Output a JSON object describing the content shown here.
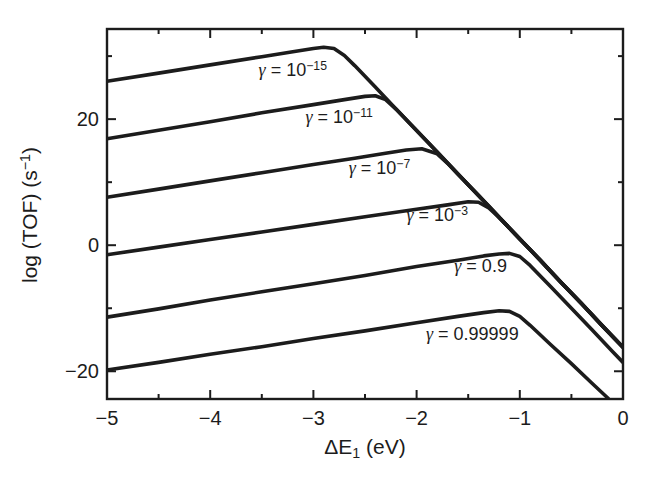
{
  "meta": {
    "ink_color": "#1c1c1c",
    "bg_color": "#ffffff"
  },
  "axes": {
    "x": {
      "title_parts": [
        {
          "t": "ΔE"
        },
        {
          "t": "1",
          "sub": true
        },
        {
          "t": " (eV)"
        }
      ],
      "major_ticks": [
        {
          "v": -5,
          "label": "−5"
        },
        {
          "v": -4,
          "label": "−4"
        },
        {
          "v": -3,
          "label": "−3"
        },
        {
          "v": -2,
          "label": "−2"
        },
        {
          "v": -1,
          "label": "−1"
        },
        {
          "v": 0,
          "label": "0"
        }
      ],
      "minor_ticks": [
        -4.5,
        -3.5,
        -2.5,
        -1.5,
        -0.5
      ]
    },
    "y": {
      "title_parts": [
        {
          "t": "log (TOF) (s"
        },
        {
          "t": "−1",
          "sup": true
        },
        {
          "t": ")"
        }
      ],
      "major_ticks": [
        {
          "v": 20,
          "label": "20"
        },
        {
          "v": 0,
          "label": "0"
        },
        {
          "v": -20,
          "label": "−20"
        }
      ],
      "minor_ticks": [
        30,
        10,
        -10
      ]
    }
  },
  "chart_data": {
    "type": "line",
    "title": "",
    "xlabel": "ΔE₁ (eV)",
    "ylabel": "log (TOF) (s⁻¹)",
    "xlim": [
      -5,
      0
    ],
    "ylim": [
      -24.4,
      34.3
    ],
    "grid": false,
    "legend_position": "inline-labels",
    "line_color": "#1c1c1c",
    "series": [
      {
        "id": "gamma-1e-15",
        "name": "γ = 10⁻¹⁵",
        "label_parts": [
          {
            "t": "γ",
            "italic": true
          },
          {
            "t": " = 10"
          },
          {
            "t": "−15",
            "sup": true
          }
        ],
        "label_pos": {
          "x": -3.2,
          "y": 27.8
        },
        "points": [
          [
            -5,
            26.0
          ],
          [
            -4.5,
            27.3
          ],
          [
            -4,
            28.6
          ],
          [
            -3.5,
            29.9
          ],
          [
            -3.2,
            30.7
          ],
          [
            -3,
            31.2
          ],
          [
            -2.9,
            31.4
          ],
          [
            -2.8,
            31.2
          ],
          [
            -2.7,
            30.1
          ],
          [
            -2.6,
            28.5
          ],
          [
            -2.4,
            25.1
          ],
          [
            -2.2,
            21.6
          ],
          [
            -2,
            18.2
          ],
          [
            -1.8,
            14.8
          ],
          [
            -1.6,
            11.3
          ],
          [
            -1.4,
            7.9
          ],
          [
            -1.2,
            4.4
          ],
          [
            -1,
            1.0
          ],
          [
            -0.8,
            -2.4
          ],
          [
            -0.6,
            -5.9
          ],
          [
            -0.4,
            -9.3
          ],
          [
            -0.2,
            -12.8
          ],
          [
            0,
            -16.2
          ]
        ]
      },
      {
        "id": "gamma-1e-11",
        "name": "γ = 10⁻¹¹",
        "label_parts": [
          {
            "t": "γ",
            "italic": true
          },
          {
            "t": " = 10"
          },
          {
            "t": "−11",
            "sup": true
          }
        ],
        "label_pos": {
          "x": -2.75,
          "y": 20.3
        },
        "points": [
          [
            -5,
            16.9
          ],
          [
            -4.5,
            18.25
          ],
          [
            -4,
            19.6
          ],
          [
            -3.5,
            21.0
          ],
          [
            -3,
            22.3
          ],
          [
            -2.7,
            23.1
          ],
          [
            -2.5,
            23.6
          ],
          [
            -2.4,
            23.7
          ],
          [
            -2.3,
            23.1
          ],
          [
            -2.2,
            21.6
          ],
          [
            -2,
            18.2
          ],
          [
            -1.8,
            14.8
          ],
          [
            -1.6,
            11.3
          ],
          [
            -1.4,
            7.9
          ],
          [
            -1.2,
            4.4
          ],
          [
            -1,
            1.0
          ],
          [
            -0.8,
            -2.4
          ],
          [
            -0.6,
            -5.9
          ],
          [
            -0.4,
            -9.3
          ],
          [
            -0.2,
            -12.8
          ],
          [
            0,
            -16.2
          ]
        ]
      },
      {
        "id": "gamma-1e-7",
        "name": "γ = 10⁻⁷",
        "label_parts": [
          {
            "t": "γ",
            "italic": true
          },
          {
            "t": " = 10"
          },
          {
            "t": "−7",
            "sup": true
          }
        ],
        "label_pos": {
          "x": -2.36,
          "y": 12.2
        },
        "points": [
          [
            -5,
            7.6
          ],
          [
            -4.5,
            8.9
          ],
          [
            -4,
            10.2
          ],
          [
            -3.5,
            11.5
          ],
          [
            -3,
            12.8
          ],
          [
            -2.6,
            13.8
          ],
          [
            -2.3,
            14.6
          ],
          [
            -2.1,
            15.1
          ],
          [
            -1.95,
            15.3
          ],
          [
            -1.8,
            14.5
          ],
          [
            -1.7,
            13.0
          ],
          [
            -1.5,
            9.6
          ],
          [
            -1.3,
            6.2
          ],
          [
            -1.1,
            2.7
          ],
          [
            -0.9,
            -0.7
          ],
          [
            -0.7,
            -4.2
          ],
          [
            -0.5,
            -7.6
          ],
          [
            -0.3,
            -11.0
          ],
          [
            -0.1,
            -14.5
          ],
          [
            0,
            -16.2
          ]
        ]
      },
      {
        "id": "gamma-1e-3",
        "name": "γ = 10⁻³",
        "label_parts": [
          {
            "t": "γ",
            "italic": true
          },
          {
            "t": " = 10"
          },
          {
            "t": "−3",
            "sup": true
          }
        ],
        "label_pos": {
          "x": -1.8,
          "y": 4.8
        },
        "points": [
          [
            -5,
            -1.5
          ],
          [
            -4.5,
            -0.3
          ],
          [
            -4,
            0.9
          ],
          [
            -3.5,
            2.1
          ],
          [
            -3,
            3.3
          ],
          [
            -2.5,
            4.5
          ],
          [
            -2,
            5.7
          ],
          [
            -1.7,
            6.4
          ],
          [
            -1.5,
            6.9
          ],
          [
            -1.4,
            6.8
          ],
          [
            -1.3,
            5.9
          ],
          [
            -1.2,
            4.4
          ],
          [
            -1,
            1.0
          ],
          [
            -0.8,
            -2.4
          ],
          [
            -0.6,
            -5.9
          ],
          [
            -0.4,
            -9.3
          ],
          [
            -0.2,
            -12.8
          ],
          [
            0,
            -16.2
          ]
        ]
      },
      {
        "id": "gamma-0p9",
        "name": "γ = 0.9",
        "label_parts": [
          {
            "t": "γ",
            "italic": true
          },
          {
            "t": " = 0.9"
          }
        ],
        "label_pos": {
          "x": -1.38,
          "y": -3.3
        },
        "points": [
          [
            -5,
            -11.4
          ],
          [
            -4.5,
            -10.1
          ],
          [
            -4,
            -8.7
          ],
          [
            -3.5,
            -7.4
          ],
          [
            -3,
            -6.1
          ],
          [
            -2.5,
            -4.8
          ],
          [
            -2,
            -3.4
          ],
          [
            -1.6,
            -2.4
          ],
          [
            -1.35,
            -1.7
          ],
          [
            -1.2,
            -1.4
          ],
          [
            -1.1,
            -1.3
          ],
          [
            -1,
            -1.8
          ],
          [
            -0.9,
            -3.2
          ],
          [
            -0.7,
            -6.6
          ],
          [
            -0.5,
            -10.0
          ],
          [
            -0.3,
            -13.4
          ],
          [
            -0.1,
            -16.9
          ],
          [
            0,
            -18.6
          ]
        ]
      },
      {
        "id": "gamma-0p99999",
        "name": "γ = 0.99999",
        "label_parts": [
          {
            "t": "γ",
            "italic": true
          },
          {
            "t": " = 0.99999"
          }
        ],
        "label_pos": {
          "x": -1.46,
          "y": -14.1
        },
        "points": [
          [
            -5,
            -19.8
          ],
          [
            -4.5,
            -18.6
          ],
          [
            -4,
            -17.3
          ],
          [
            -3.5,
            -16.1
          ],
          [
            -3,
            -14.8
          ],
          [
            -2.5,
            -13.6
          ],
          [
            -2,
            -12.3
          ],
          [
            -1.6,
            -11.3
          ],
          [
            -1.35,
            -10.7
          ],
          [
            -1.2,
            -10.4
          ],
          [
            -1.1,
            -10.5
          ],
          [
            -1,
            -11.3
          ],
          [
            -0.9,
            -12.7
          ],
          [
            -0.7,
            -15.8
          ],
          [
            -0.5,
            -18.8
          ],
          [
            -0.3,
            -21.9
          ],
          [
            -0.15,
            -24.2
          ],
          [
            -0.1,
            -25.2
          ]
        ]
      }
    ]
  }
}
